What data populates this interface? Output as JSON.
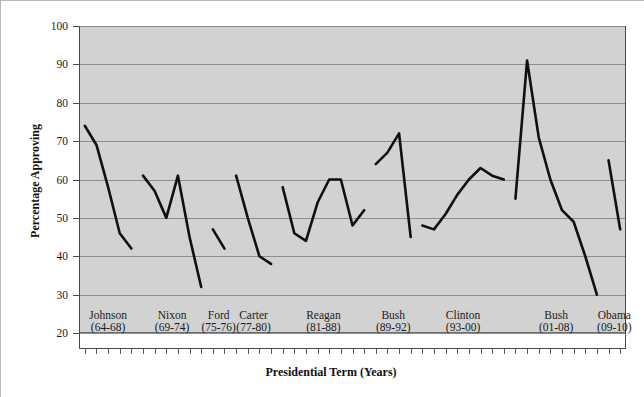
{
  "chart_data": {
    "type": "line",
    "title": "",
    "xlabel": "Presidential Term (Years)",
    "ylabel": "Percentage Approving",
    "ylim": [
      20,
      100
    ],
    "ytick_step": 10,
    "yticks": [
      20,
      30,
      40,
      50,
      60,
      70,
      80,
      90,
      100
    ],
    "ytick_labels": [
      "20",
      "30",
      "40",
      "50",
      "60",
      "70",
      "80",
      "90",
      "100"
    ],
    "grid": true,
    "grid_axis": "y",
    "legend": "none",
    "xlim": [
      1963.5,
      2010.5
    ],
    "x_minor_ticks": "yearly",
    "categories": [
      "Johnson (64-68)",
      "Nixon (69-74)",
      "Ford (75-76)",
      "Carter (77-80)",
      "Reagan (81-88)",
      "Bush (89-92)",
      "Clinton (93-00)",
      "Bush (01-08)",
      "Obama (09-10)"
    ],
    "category_labels": [
      {
        "name": "Johnson",
        "years": "(64-68)"
      },
      {
        "name": "Nixon",
        "years": "(69-74)"
      },
      {
        "name": "Ford",
        "years": "(75-76)"
      },
      {
        "name": "Carter",
        "years": "(77-80)"
      },
      {
        "name": "Reagan",
        "years": "(81-88)"
      },
      {
        "name": "Bush",
        "years": "(89-92)"
      },
      {
        "name": "Clinton",
        "years": "(93-00)"
      },
      {
        "name": "Bush",
        "years": "(01-08)"
      },
      {
        "name": "Obama",
        "years": "(09-10)"
      }
    ],
    "series": [
      {
        "name": "Johnson (64-68)",
        "x": [
          1964,
          1965,
          1966,
          1967,
          1968
        ],
        "values": [
          74,
          69,
          58,
          46,
          42
        ]
      },
      {
        "name": "Nixon (69-74)",
        "x": [
          1969,
          1970,
          1971,
          1972,
          1973,
          1974
        ],
        "values": [
          61,
          57,
          50,
          61,
          45,
          32
        ]
      },
      {
        "name": "Ford (75-76)",
        "x": [
          1975,
          1976
        ],
        "values": [
          47,
          42
        ]
      },
      {
        "name": "Carter (77-80)",
        "x": [
          1977,
          1978,
          1979,
          1980
        ],
        "values": [
          61,
          50,
          40,
          38
        ]
      },
      {
        "name": "Reagan (81-88)",
        "x": [
          1981,
          1982,
          1983,
          1984,
          1985,
          1986,
          1987,
          1988
        ],
        "values": [
          58,
          46,
          44,
          54,
          60,
          60,
          48,
          52
        ]
      },
      {
        "name": "Bush (89-92)",
        "x": [
          1989,
          1990,
          1991,
          1992
        ],
        "values": [
          64,
          67,
          72,
          45
        ]
      },
      {
        "name": "Clinton (93-00)",
        "x": [
          1993,
          1994,
          1995,
          1996,
          1997,
          1998,
          1999,
          2000
        ],
        "values": [
          48,
          47,
          51,
          56,
          60,
          63,
          61,
          60
        ]
      },
      {
        "name": "Bush (01-08)",
        "x": [
          2001,
          2002,
          2003,
          2004,
          2005,
          2006,
          2007,
          2008
        ],
        "values": [
          55,
          91,
          71,
          60,
          52,
          49,
          40,
          30
        ]
      },
      {
        "name": "Obama (09-10)",
        "x": [
          2009,
          2010
        ],
        "values": [
          65,
          47
        ]
      }
    ],
    "colors": {
      "line": "#101010",
      "plot_background": "#d2d2d2",
      "gridline": "#8e8e8e",
      "text": "#1a1a1a",
      "figure_background": "#ffffff"
    }
  }
}
